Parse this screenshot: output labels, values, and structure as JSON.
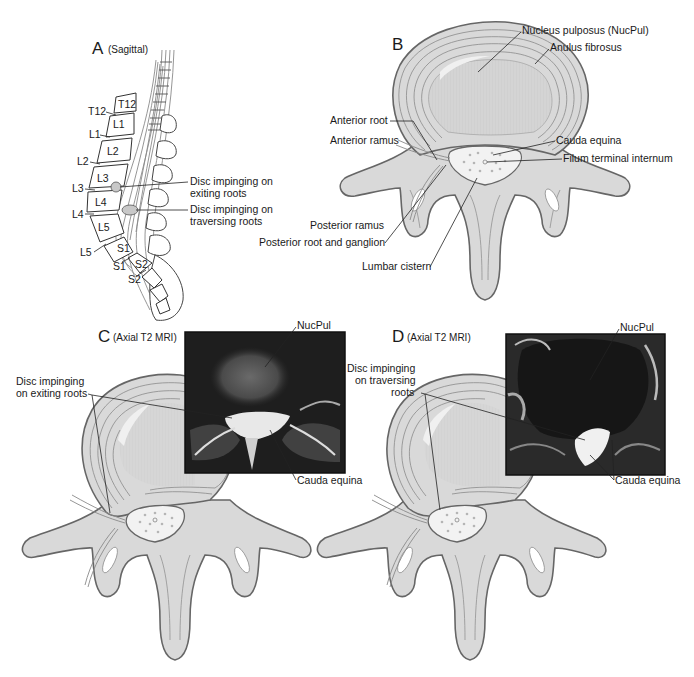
{
  "figure": {
    "panels": [
      {
        "id": "A",
        "letter": "A",
        "subtitle": "(Sagittal)",
        "vertebra_labels": [
          "T12",
          "L1",
          "L2",
          "L3",
          "L4",
          "L5",
          "S1",
          "S2"
        ],
        "disc_labels": [
          "T12",
          "L1",
          "L2",
          "L3",
          "L4",
          "L5",
          "S1",
          "S2"
        ],
        "annotations": [
          {
            "line1": "Disc impinging on",
            "line2": "exiting roots"
          },
          {
            "line1": "Disc impinging on",
            "line2": "traversing roots"
          }
        ]
      },
      {
        "id": "B",
        "letter": "B",
        "subtitle": "",
        "annotations": {
          "nucleus": "Nucleus pulposus (NucPul)",
          "anulus": "Anulus fibrosus",
          "anterior_root": "Anterior root",
          "anterior_ramus": "Anterior ramus",
          "cauda_equina": "Cauda equina",
          "filum": "Filum terminal internum",
          "posterior_ramus": "Posterior ramus",
          "posterior_root": "Posterior root and ganglion",
          "lumbar_cistern": "Lumbar cistern"
        }
      },
      {
        "id": "C",
        "letter": "C",
        "subtitle": "(Axial T2 MRI)",
        "annotations": {
          "nucpul": "NucPul",
          "disc_line1": "Disc impinging",
          "disc_line2": "on exiting roots",
          "cauda": "Cauda equina"
        }
      },
      {
        "id": "D",
        "letter": "D",
        "subtitle": "(Axial T2 MRI)",
        "annotations": {
          "nucpul": "NucPul",
          "disc_line1": "Disc impinging",
          "disc_line2": "on traversing",
          "disc_line3": "roots",
          "cauda": "Cauda equina"
        }
      }
    ],
    "colors": {
      "bone_fill": "#d9d9d9",
      "bone_stroke": "#666666",
      "mri_bg": "#1c1c1c",
      "text": "#1a1a1a"
    }
  }
}
